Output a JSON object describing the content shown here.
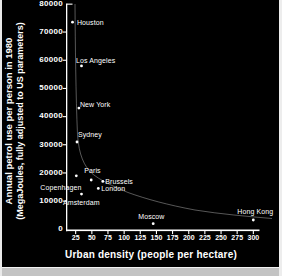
{
  "colors": {
    "background": "#000000",
    "foreground": "#ffffff",
    "border": "#e9e9e9",
    "curve": "#c8c8c8"
  },
  "chart_data": {
    "type": "scatter",
    "title": "",
    "xlabel": "Urban density (people per hectare)",
    "ylabel_line1": "Annual petrol use per person in 1980",
    "ylabel_line2": "(MegaJoules, fully adjusted to US parameters)",
    "xlim": [
      10,
      310
    ],
    "ylim": [
      0,
      80000
    ],
    "x_ticks": [
      25,
      50,
      75,
      100,
      125,
      150,
      175,
      200,
      225,
      250,
      275,
      300
    ],
    "y_ticks": [
      0,
      10000,
      20000,
      30000,
      40000,
      50000,
      60000,
      70000,
      80000
    ],
    "grid": false,
    "legend": false,
    "trend_curve": "descending hyperbolic curve from top-left to bottom-right",
    "points": [
      {
        "city": "Houston",
        "density": 20,
        "petrol_mj": 73500,
        "label_dx": 4.5,
        "label_dy": -3.5
      },
      {
        "city": "Los Angeles",
        "density": 34,
        "petrol_mj": 58000,
        "label_dx": -5.5,
        "label_dy": -8.5
      },
      {
        "city": "New York",
        "density": 30,
        "petrol_mj": 43000,
        "label_dx": 1,
        "label_dy": -7
      },
      {
        "city": "Sydney",
        "density": 27,
        "petrol_mj": 31000,
        "label_dx": 1,
        "label_dy": -10.5
      },
      {
        "city": "Copenhagen",
        "density": 26,
        "petrol_mj": 19000,
        "label_dx": -36,
        "label_dy": 8
      },
      {
        "city": "Paris",
        "density": 49,
        "petrol_mj": 17500,
        "label_dx": -7,
        "label_dy": -13
      },
      {
        "city": "Brussels",
        "density": 67,
        "petrol_mj": 17000,
        "label_dx": 2.5,
        "label_dy": -3.5
      },
      {
        "city": "London",
        "density": 60,
        "petrol_mj": 14500,
        "label_dx": 3,
        "label_dy": -3.5
      },
      {
        "city": "Amsterdam",
        "density": 34,
        "petrol_mj": 12500,
        "label_dx": -18.5,
        "label_dy": 5
      },
      {
        "city": "Moscow",
        "density": 145,
        "petrol_mj": 2000,
        "label_dx": -15,
        "label_dy": -11
      },
      {
        "city": "Hong Kong",
        "density": 300,
        "petrol_mj": 3300,
        "label_dx": -16,
        "label_dy": -12
      }
    ]
  }
}
